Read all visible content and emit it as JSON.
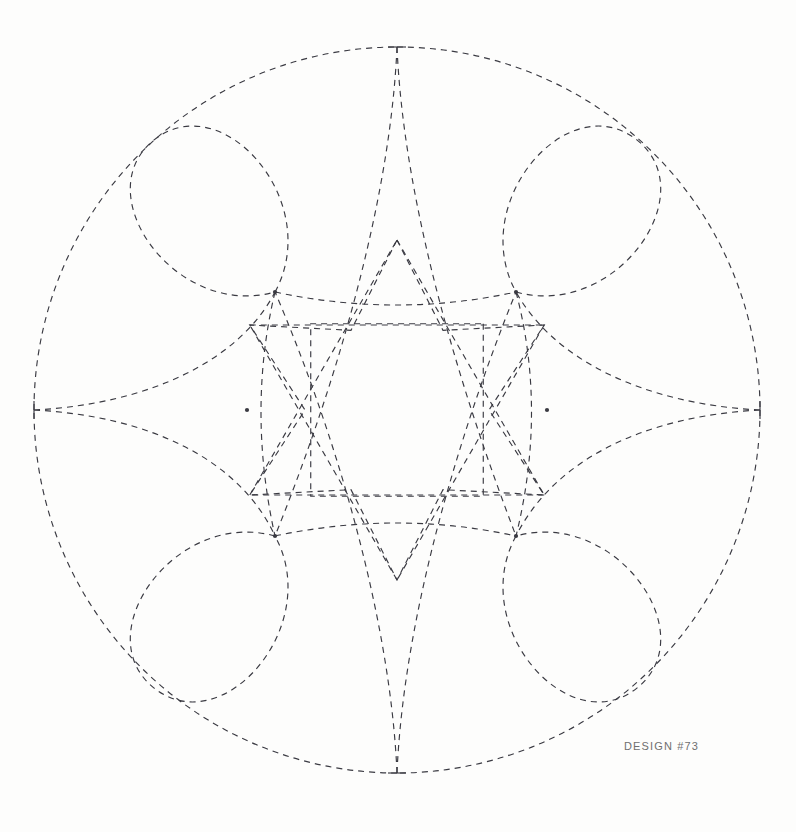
{
  "page": {
    "background_color": "#fdfdfc",
    "width": 796,
    "height": 832
  },
  "label": {
    "text": "DESIGN #73",
    "color": "#6f6f6f"
  },
  "figure": {
    "title": "DESIGN #73",
    "stroke_color": "#3a3a42",
    "stroke_width": 1.15,
    "dash_pattern": "6 5",
    "center_x": 397,
    "center_y": 410,
    "outer_radius": 363,
    "node_radius": 150,
    "inner_star_outer_radius": 170,
    "inner_star_inner_radius": 92
  },
  "chart_data": {
    "type": "line",
    "title": "DESIGN #73",
    "subtitle": "",
    "xlabel": "",
    "ylabel": "",
    "grid": false,
    "legend": "none",
    "center": [
      397,
      410
    ],
    "outer_circle_radius": 363,
    "cusps": [
      {
        "name": "top-cusp",
        "x": 397,
        "y": 47
      },
      {
        "name": "right-cusp",
        "x": 760,
        "y": 410
      },
      {
        "name": "bottom-cusp",
        "x": 397,
        "y": 773
      },
      {
        "name": "left-cusp",
        "x": 34,
        "y": 410
      }
    ],
    "nodes": [
      {
        "name": "node-upper-left",
        "x": 275,
        "y": 292
      },
      {
        "name": "node-upper-right",
        "x": 516,
        "y": 292
      },
      {
        "name": "node-lower-right",
        "x": 516,
        "y": 536
      },
      {
        "name": "node-lower-left",
        "x": 275,
        "y": 536
      },
      {
        "name": "node-left",
        "x": 247,
        "y": 410
      },
      {
        "name": "node-right",
        "x": 547,
        "y": 410
      }
    ],
    "star_points": [
      {
        "name": "star-point-top",
        "x": 397,
        "y": 242
      },
      {
        "name": "star-point-upper-right",
        "x": 544,
        "y": 326
      },
      {
        "name": "star-point-lower-right",
        "x": 544,
        "y": 494
      },
      {
        "name": "star-point-bottom",
        "x": 397,
        "y": 578
      },
      {
        "name": "star-point-lower-left",
        "x": 250,
        "y": 494
      },
      {
        "name": "star-point-upper-left",
        "x": 250,
        "y": 326
      }
    ],
    "petal_count": 6,
    "cusp_count": 4,
    "series": [
      {
        "name": "outer-cusped-circle",
        "values": [
          363,
          363,
          363,
          363
        ]
      },
      {
        "name": "petal-loops",
        "values": [
          150,
          150,
          150,
          150,
          150,
          150
        ]
      },
      {
        "name": "inner-star",
        "values": [
          170,
          92,
          170,
          92,
          170,
          92,
          170,
          92,
          170,
          92,
          170,
          92
        ]
      }
    ]
  }
}
